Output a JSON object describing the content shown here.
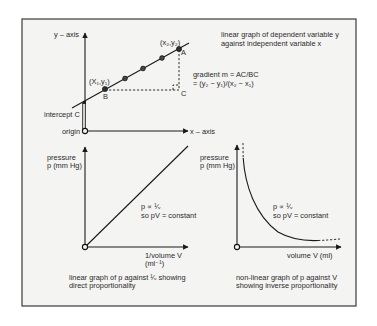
{
  "graph_top": {
    "title_line1": "linear graph of dependent variable y",
    "title_line2": "against independent variable x",
    "y_axis_label": "y – axis",
    "x_axis_label": "x – axis",
    "origin_label": "origin",
    "intercept_label": "intercept C",
    "point_a_label": "A",
    "point_b_label": "B",
    "point_c_label": "C",
    "point_a_coord": "(x₂,y₂)",
    "point_b_coord": "(X₁,y₁)",
    "gradient_line1": "gradient m = AC/BC",
    "gradient_line2": "= (y₂ − y₁)/(x₂ − x₁)"
  },
  "graph_bottom_left": {
    "y_axis_label_line1": "pressure",
    "y_axis_label_line2": "p (mm Hg)",
    "x_axis_label_line1": "1/volume V",
    "x_axis_label_line2": "(ml⁻¹)",
    "relation_line1": "p ∝ ¹⁄ᵥ",
    "relation_line2": "so pV = constant",
    "caption_line1": "linear graph of p against ¹⁄ᵥ showing",
    "caption_line2": "direct proportionality"
  },
  "graph_bottom_right": {
    "y_axis_label_line1": "pressure",
    "y_axis_label_line2": "p (mm Hg)",
    "x_axis_label": "volume V (ml)",
    "relation_line1": "p ∝ ¹⁄ᵥ",
    "relation_line2": "so pV = constant",
    "caption_line1": "non-linear graph of p against V",
    "caption_line2": "showing inverse proportionality"
  },
  "colors": {
    "background": "#ffffff",
    "panel": "#f4f4f2",
    "ink": "#1a1a1a"
  }
}
